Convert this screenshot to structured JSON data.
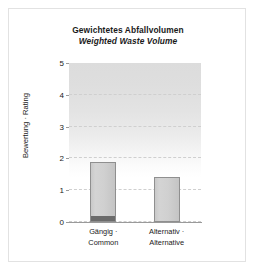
{
  "chart_data": {
    "type": "bar",
    "title": "Gewichtetes Abfallvolumen",
    "subtitle": "Weighted Waste Volume",
    "xlabel": "",
    "ylabel": "Bewertung · Rating",
    "categories": [
      "Gängig ·\nCommon",
      "Alternativ ·\nAlternative"
    ],
    "category_labels": [
      {
        "line1": "Gängig ·",
        "line2": "Common"
      },
      {
        "line1": "Alternativ ·",
        "line2": "Alternative"
      }
    ],
    "values": [
      1.9,
      1.4
    ],
    "series": [
      {
        "name": "Bewertung · Rating",
        "values": [
          1.9,
          1.4
        ]
      }
    ],
    "base_segment_values": [
      0.15,
      0.0
    ],
    "ylim": [
      0,
      5
    ],
    "ytick_labels": [
      "0",
      "1",
      "2",
      "3",
      "4",
      "5"
    ],
    "ytick_values": [
      0,
      1,
      2,
      3,
      4,
      5
    ],
    "grid": true,
    "grid_axis": "y",
    "legend": false,
    "legend_position": "none"
  },
  "colors": {
    "bar_fill": "#d0d0d0",
    "bar_edge": "#8f8f8f",
    "base_segment": "#6b6b6b",
    "gridline": "#cfcfcf",
    "axis": "#9a9a9a",
    "frame": "#e2e2e2",
    "text": "#1a1a1a",
    "plot_background_top": "#dcdcdc",
    "plot_background_bottom": "#ffffff"
  }
}
